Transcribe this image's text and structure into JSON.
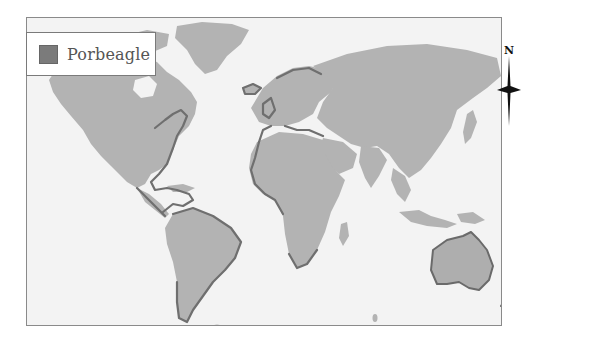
{
  "map": {
    "title": "Porbeagle distribution",
    "colors": {
      "background": "#f3f3f3",
      "land": "#b3b3b3",
      "range_stroke": "#6f6f6f",
      "frame_border": "#8a8a8a"
    },
    "legend": {
      "items": [
        {
          "label": "Porbeagle",
          "swatch_color": "#7b7b7b"
        }
      ]
    },
    "compass": {
      "label": "N"
    },
    "highlighted_regions": [
      "North Atlantic (NE North America coast, Gulf of Mexico, Caribbean)",
      "NE Atlantic (Europe, Mediterranean, NW Africa)",
      "South America coasts",
      "Southern Africa coast",
      "Southern Australia",
      "New Zealand",
      "Sub-Antarctic islands"
    ]
  }
}
